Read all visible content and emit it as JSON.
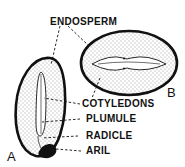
{
  "diagram": {
    "labels": {
      "endosperm": "ENDOSPERM",
      "cotyledons": "COTYLEDONS",
      "plumule": "PLUMULE",
      "radicle": "RADICLE",
      "aril": "ARIL"
    },
    "figures": {
      "a": "A",
      "b": "B"
    },
    "colors": {
      "ink": "#111111",
      "background": "#ffffff"
    }
  }
}
